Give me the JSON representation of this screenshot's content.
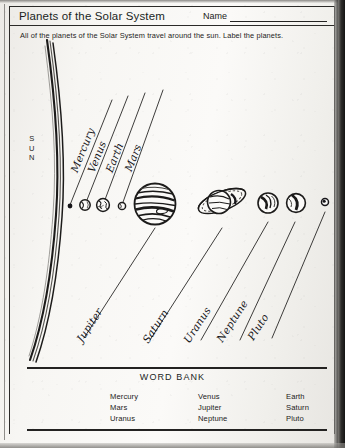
{
  "worksheet": {
    "title": "Planets of the Solar System",
    "name_label": "Name",
    "instructions": "All of the planets of the Solar System travel around the sun. Label the planets.",
    "sun_label": "S\nU\nN"
  },
  "sun": {
    "letters": [
      "S",
      "U",
      "N"
    ]
  },
  "answers": {
    "upper": [
      {
        "label": "Mercury"
      },
      {
        "label": "Venus"
      },
      {
        "label": "Earth"
      },
      {
        "label": "Mars"
      }
    ],
    "lower": [
      {
        "label": "Jupiter"
      },
      {
        "label": "Saturn"
      },
      {
        "label": "Uranus"
      },
      {
        "label": "Neptune"
      },
      {
        "label": "Pluto"
      }
    ]
  },
  "planets": [
    {
      "name": "mercury"
    },
    {
      "name": "venus"
    },
    {
      "name": "earth"
    },
    {
      "name": "mars"
    },
    {
      "name": "jupiter"
    },
    {
      "name": "saturn"
    },
    {
      "name": "uranus"
    },
    {
      "name": "neptune"
    },
    {
      "name": "pluto"
    }
  ],
  "word_bank": {
    "title": "WORD BANK",
    "columns": [
      [
        "Mercury",
        "Mars",
        "Uranus"
      ],
      [
        "Venus",
        "Jupiter",
        "Neptune"
      ],
      [
        "Earth",
        "Saturn",
        "Pluto"
      ]
    ]
  },
  "colors": {
    "ink": "#232221",
    "paper": "#f7f6f3",
    "handwriting": "#17161a"
  }
}
